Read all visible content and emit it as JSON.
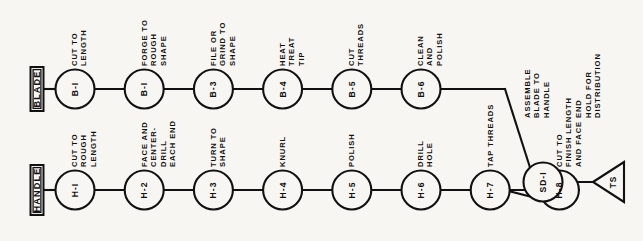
{
  "diagram": {
    "background_color": "#f8f6f2",
    "line_color": "#111111",
    "rows": [
      {
        "id": "blade",
        "label": "BLADE",
        "nodes": [
          {
            "code": "B-I",
            "desc": "CUT TO\nLENGTH"
          },
          {
            "code": "B-I",
            "desc": "FORGE TO\nROUGH\nSHAPE"
          },
          {
            "code": "B-3",
            "desc": "FILE OR\nGRIND TO\nSHAPE"
          },
          {
            "code": "B-4",
            "desc": "HEAT\nTREAT\nTIP"
          },
          {
            "code": "B-5",
            "desc": "CUT\nTHREADS"
          },
          {
            "code": "B-6",
            "desc": "CLEAN\nAND\nPOLISH"
          }
        ]
      },
      {
        "id": "handle",
        "label": "HANDLE",
        "nodes": [
          {
            "code": "H-I",
            "desc": "CUT TO\nROUGH\nLENGTH"
          },
          {
            "code": "H-2",
            "desc": "FACE AND\nCENTER-\nDRILL\nEACH END"
          },
          {
            "code": "H-3",
            "desc": "TURN TO\nSHAPE"
          },
          {
            "code": "H-4",
            "desc": "KNURL"
          },
          {
            "code": "H-5",
            "desc": "POLISH"
          },
          {
            "code": "H-6",
            "desc": "DRILL\nHOLE"
          },
          {
            "code": "H-7",
            "desc": "TAP THREADS"
          },
          {
            "code": "H-8",
            "desc": "CUT TO\nFINISH LENGTH\nAND FACE END"
          }
        ]
      }
    ],
    "assembly": {
      "code": "SD-I",
      "desc": "ASSEMBLE\nBLADE TO\nHANDLE"
    },
    "storage": {
      "code": "TS",
      "desc": "HOLD FOR\nDISTRIBUTION"
    }
  }
}
